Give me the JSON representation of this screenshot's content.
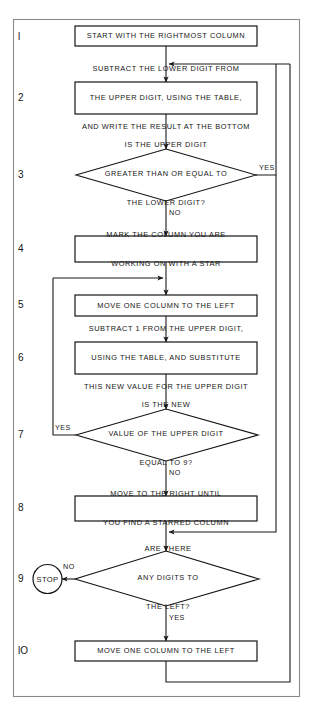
{
  "diagram": {
    "type": "flowchart",
    "frame": {
      "stroke": "#7a7a7a",
      "fill": "#ffffff"
    },
    "line_color": "#1a1a1a",
    "box_stroke": "#141414",
    "background": "#ffffff"
  },
  "steps": [
    {
      "number": "l",
      "shape": "process",
      "lines": [
        "START WITH THE RIGHTMOST COLUMN"
      ]
    },
    {
      "number": "2",
      "shape": "process",
      "lines": [
        "SUBTRACT THE LOWER DIGIT FROM",
        "THE UPPER DIGIT, USING THE TABLE,",
        "AND WRITE THE RESULT AT THE BOTTOM"
      ]
    },
    {
      "number": "3",
      "shape": "decision",
      "lines": [
        "IS THE UPPER DIGIT",
        "GREATER THAN OR EQUAL TO",
        "THE LOWER DIGIT?"
      ],
      "yes_label": "YES",
      "no_label": "NO"
    },
    {
      "number": "4",
      "shape": "process",
      "lines": [
        "MARK THE COLUMN YOU ARE",
        "WORKING ON WITH A STAR"
      ]
    },
    {
      "number": "5",
      "shape": "process",
      "lines": [
        "MOVE ONE COLUMN TO THE LEFT"
      ]
    },
    {
      "number": "6",
      "shape": "process",
      "lines": [
        "SUBTRACT 1 FROM THE UPPER DIGIT,",
        "USING THE TABLE, AND SUBSTITUTE",
        "THIS NEW VALUE FOR THE UPPER DIGIT"
      ]
    },
    {
      "number": "7",
      "shape": "decision",
      "lines": [
        "IS THE NEW",
        "VALUE OF THE UPPER DIGIT",
        "EQUAL TO 9?"
      ],
      "yes_label": "YES",
      "no_label": "NO"
    },
    {
      "number": "8",
      "shape": "process",
      "lines": [
        "MOVE TO THE RIGHT UNTIL",
        "YOU FIND A STARRED COLUMN"
      ]
    },
    {
      "number": "9",
      "shape": "decision",
      "lines": [
        "ARE THERE",
        "ANY DIGITS TO",
        "THE LEFT?"
      ],
      "yes_label": "YES",
      "no_label": "NO",
      "terminal": "STOP"
    },
    {
      "number": "lO",
      "shape": "process",
      "lines": [
        "MOVE ONE COLUMN TO THE LEFT"
      ]
    }
  ],
  "terminal": {
    "label": "STOP"
  },
  "edge_labels": {
    "d3_yes": "YES",
    "d3_no": "NO",
    "d7_yes": "YES",
    "d7_no": "NO",
    "d9_no": "NO",
    "d9_yes": "YES"
  }
}
